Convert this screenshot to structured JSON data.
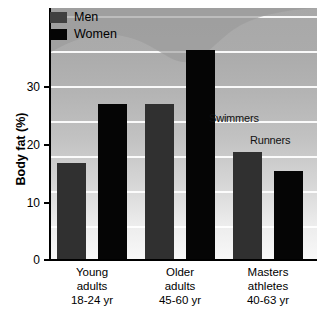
{
  "chart_data": {
    "type": "bar",
    "title": "",
    "subtitle": "",
    "xlabel": "",
    "ylabel": "Body fat (%)",
    "ylim": [
      0,
      36
    ],
    "grid": true,
    "grid_interval": 5,
    "legend_position": "top-left",
    "categories": [
      "Young adults 18-24 yr",
      "Older adults 45-60 yr",
      "Masters athletes 40-63 yr"
    ],
    "series": [
      {
        "name": "Men",
        "values": [
          13.8,
          22.3,
          15.3
        ],
        "color": "#303030"
      },
      {
        "name": "Women",
        "values": [
          22.3,
          30.0,
          12.7
        ],
        "color": "#050505"
      }
    ],
    "annotations": [
      "Swimmers",
      "Runners"
    ]
  },
  "legend": {
    "items": [
      {
        "label": "Men",
        "swatch": "men-swatch"
      },
      {
        "label": "Women",
        "swatch": "women-swatch"
      }
    ]
  },
  "y_axis": {
    "title": "Body fat (%)",
    "ticks": [
      {
        "value": 0,
        "label": "0"
      },
      {
        "value": 10,
        "label": "10"
      },
      {
        "value": 20,
        "label": "20"
      },
      {
        "value": 30,
        "label": "30"
      }
    ]
  },
  "x_axis": {
    "groups": [
      {
        "line1": "Young",
        "line2": "adults",
        "line3": "18-24 yr"
      },
      {
        "line1": "Older",
        "line2": "adults",
        "line3": "45-60 yr"
      },
      {
        "line1": "Masters",
        "line2": "athletes",
        "line3": "40-63 yr"
      }
    ]
  },
  "annotations": {
    "swimmers": "Swimmers",
    "runners": "Runners"
  },
  "colors": {
    "men": "#303030",
    "women": "#050505",
    "gridline": "#ffffff",
    "axis": "#000000",
    "band": "#9a9a9a"
  }
}
